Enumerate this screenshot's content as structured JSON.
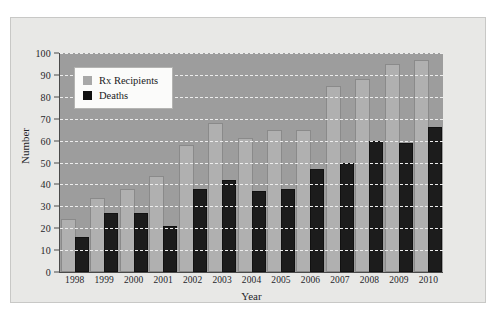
{
  "chart_data": {
    "type": "bar",
    "title": "",
    "xlabel": "Year",
    "ylabel": "Number",
    "categories": [
      "1998",
      "1999",
      "2000",
      "2001",
      "2002",
      "2003",
      "2004",
      "2005",
      "2006",
      "2007",
      "2008",
      "2009",
      "2010"
    ],
    "series": [
      {
        "name": "Rx Recipients",
        "color": "#b0b0b0",
        "values": [
          24,
          34,
          38,
          44,
          58,
          68,
          61,
          65,
          65,
          85,
          88,
          95,
          97
        ]
      },
      {
        "name": "Deaths",
        "color": "#1c1c1c",
        "values": [
          16,
          27,
          27,
          21,
          38,
          42,
          37,
          38,
          47,
          50,
          60,
          59,
          66
        ]
      }
    ],
    "ylim": [
      0,
      100
    ],
    "yticks": [
      0,
      10,
      20,
      30,
      40,
      50,
      60,
      70,
      80,
      90,
      100
    ],
    "grid": true,
    "legend_position": "upper-left"
  },
  "legend": {
    "entries": [
      {
        "label": "Rx Recipients",
        "swatch": "rx"
      },
      {
        "label": "Deaths",
        "swatch": "deaths"
      }
    ]
  },
  "colors": {
    "plot_background": "#9d9d9d",
    "figure_background": "#e8e8e6",
    "gridline": "#ededed",
    "axis": "#4a4a4a",
    "rx_recipients": "#b0b0b0",
    "deaths": "#1c1c1c"
  }
}
